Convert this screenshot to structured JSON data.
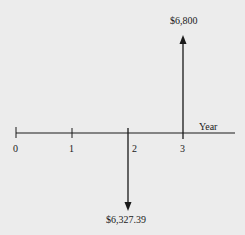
{
  "diagram": {
    "type": "cash-flow timeline",
    "axis_label": "Year",
    "ticks": [
      "0",
      "1",
      "2",
      "3"
    ],
    "cash_flows": [
      {
        "year": 2,
        "direction": "out",
        "amount": "$6,327.39"
      },
      {
        "year": 3,
        "direction": "in",
        "amount": "$6,800"
      }
    ]
  },
  "colors": {
    "background": "#ececec",
    "ink": "#1a1a1a"
  }
}
